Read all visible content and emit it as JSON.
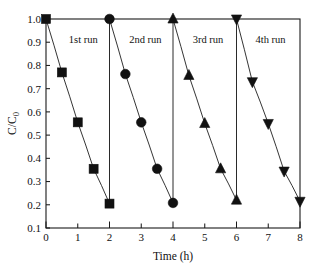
{
  "chart_data": {
    "type": "line",
    "title": "",
    "subtitle": "",
    "xlabel": "Time (h)",
    "ylabel": "C/C",
    "ylabel_sub": "0",
    "xlim": [
      0,
      8
    ],
    "ylim": [
      0.1,
      1.0
    ],
    "grid": false,
    "legend": "none",
    "x_ticks": [
      "0",
      "1",
      "2",
      "3",
      "4",
      "5",
      "6",
      "7",
      "8"
    ],
    "x_tick_values": [
      0,
      1,
      2,
      3,
      4,
      5,
      6,
      7,
      8
    ],
    "y_ticks": [
      "0.1",
      "0.2",
      "0.3",
      "0.4",
      "0.5",
      "0.6",
      "0.7",
      "0.8",
      "0.9",
      "1.0"
    ],
    "y_tick_values": [
      0.1,
      0.2,
      0.3,
      0.4,
      0.5,
      0.6,
      0.7,
      0.8,
      0.9,
      1.0
    ],
    "annotations": [
      {
        "text": "1st run",
        "x": 0.72,
        "y": 0.895
      },
      {
        "text": "2nd run",
        "x": 2.62,
        "y": 0.895
      },
      {
        "text": "3rd run",
        "x": 4.62,
        "y": 0.895
      },
      {
        "text": "4th run",
        "x": 6.6,
        "y": 0.895
      }
    ],
    "series": [
      {
        "name": "1st run",
        "marker": "square",
        "x": [
          0.0,
          0.5,
          1.0,
          1.5,
          2.0
        ],
        "values": [
          1.0,
          0.77,
          0.555,
          0.355,
          0.205
        ],
        "reset_line": {
          "x": 2.0,
          "y_from": 0.205,
          "y_to": 1.0
        }
      },
      {
        "name": "2nd run",
        "marker": "circle",
        "x": [
          2.0,
          2.5,
          3.0,
          3.5,
          4.0
        ],
        "values": [
          1.0,
          0.763,
          0.555,
          0.355,
          0.208
        ],
        "reset_line": {
          "x": 4.0,
          "y_from": 0.208,
          "y_to": 1.0
        }
      },
      {
        "name": "3rd run",
        "marker": "triangle-up",
        "x": [
          4.0,
          4.5,
          5.0,
          5.5,
          6.0
        ],
        "values": [
          1.0,
          0.757,
          0.55,
          0.355,
          0.22
        ],
        "reset_line": {
          "x": 6.0,
          "y_from": 0.22,
          "y_to": 1.0
        }
      },
      {
        "name": "4th run",
        "marker": "triangle-down",
        "x": [
          6.0,
          6.5,
          7.0,
          7.5,
          8.0
        ],
        "values": [
          1.0,
          0.73,
          0.55,
          0.345,
          0.215
        ],
        "reset_line": null
      }
    ],
    "colors": {
      "marker": "#111111",
      "line": "#2a2a2a",
      "axis": "#1a1a1a",
      "background": "#ffffff"
    }
  }
}
